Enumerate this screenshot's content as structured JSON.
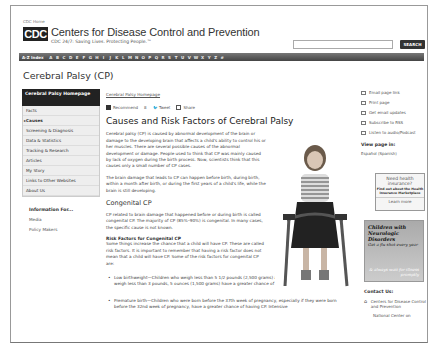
{
  "header": {
    "cdc_home": "CDC Home",
    "logo": "CDC",
    "title": "Centers for Disease Control and Prevention",
    "tagline": "CDC 24/7: Saving Lives. Protecting People.™",
    "search_button": "SEARCH",
    "search_placeholder": ""
  },
  "az_index": {
    "label": "A-Z Index",
    "letters": [
      "A",
      "B",
      "C",
      "D",
      "E",
      "F",
      "G",
      "H",
      "I",
      "J",
      "K",
      "L",
      "M",
      "N",
      "O",
      "P",
      "Q",
      "R",
      "S",
      "T",
      "U",
      "V",
      "W",
      "X",
      "Y",
      "Z",
      "#"
    ]
  },
  "page_title": "Cerebral Palsy (CP)",
  "sidebar": {
    "home": "Cerebral Palsy Homepage",
    "items": [
      {
        "label": "Facts"
      },
      {
        "label": "Causes"
      },
      {
        "label": "Screening & Diagnosis"
      },
      {
        "label": "Data & Statistics"
      },
      {
        "label": "Tracking & Research"
      },
      {
        "label": "Articles"
      },
      {
        "label": "My Story"
      },
      {
        "label": "Links to Other Websites"
      },
      {
        "label": "About Us"
      }
    ],
    "info_for": {
      "title": "Information For...",
      "items": [
        "Media",
        "Policy Makers"
      ]
    }
  },
  "content": {
    "breadcrumb": "Cerebral Palsy Homepage",
    "social": {
      "facebook": "Recommend",
      "facebook_count": "8",
      "tweet": "Tweet",
      "share": "Share"
    },
    "heading": "Causes and Risk Factors of Cerebral Palsy",
    "p1": "Cerebral palsy (CP) is caused by abnormal development of the brain or damage to the developing brain that affects a child's ability to control his or her muscles. There are several possible causes of the abnormal development or damage. People used to think that CP was mainly caused by lack of oxygen during the birth process. Now, scientists think that this causes only a small number of CP cases.",
    "p2": "The brain damage that leads to CP can happen before birth, during birth, within a month after birth, or during the first years of a child's life, while the brain is still developing.",
    "congenital_heading": "Congenital CP",
    "p3": "CP related to brain damage that happened before or during birth is called congenital CP. The majority of CP (85%–90%) is congenital. In many cases, the specific cause is not known.",
    "risk_heading": "Risk Factors for Congenital CP",
    "p4": "Some things increase the chance that a child will have CP. These are called risk factors. It is important to remember that having a risk factor does not mean that a child will have CP. Some of the risk factors for congenital CP are:",
    "bullets": [
      "Low birthweight—Children who weigh less than 5 1/2 pounds (2,500 grams) at birth, and especially those who weigh less than 3 pounds, 5 ounces (1,500 grams) have a greater chance of having CP.",
      "Premature birth—Children who were born before the 37th week of pregnancy, especially if they were born before the 32nd week of pregnancy, have a greater chance of having CP. Intensive"
    ]
  },
  "right": {
    "tools": [
      {
        "label": "Email page link",
        "icon": "email-icon"
      },
      {
        "label": "Print page",
        "icon": "print-icon"
      },
      {
        "label": "Get email updates",
        "icon": "email-updates-icon"
      },
      {
        "label": "Subscribe to RSS",
        "icon": "rss-icon"
      },
      {
        "label": "Listen to audio/Podcast",
        "icon": "headphones-icon"
      }
    ],
    "view_page_in": "View page in:",
    "espanol": "Español (Spanish)",
    "ad_insurance": {
      "title": "Need health insurance?",
      "sub": "Find out about the Health Insurance Marketplace",
      "link": "Learn more"
    },
    "ad_neuro": {
      "title": "Children with Neurologic Disorders",
      "sub": "Get a flu shot every year",
      "bottom": "& always wait for illness promptly"
    },
    "contact": {
      "title": "Contact Us:",
      "org": "Centers for Disease Control and Prevention",
      "sub": "National Center on"
    }
  }
}
